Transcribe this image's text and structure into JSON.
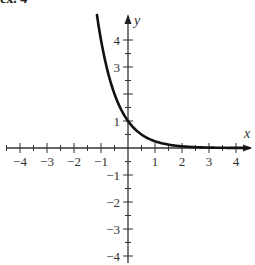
{
  "header": {
    "clipped_text": "ex. 4"
  },
  "chart_data": {
    "type": "line",
    "title": "",
    "xlabel": "x",
    "ylabel": "y",
    "xlim": [
      -4.5,
      4.5
    ],
    "ylim": [
      -4,
      4.9
    ],
    "xticks": [
      -4,
      -3,
      -2,
      -1,
      1,
      2,
      3,
      4
    ],
    "yticks": [
      -4,
      -3,
      -2,
      -1,
      1,
      3,
      4
    ],
    "minor_tick_step": 0.5,
    "grid": false,
    "legend": null,
    "series": [
      {
        "name": "y = (1/4)^x",
        "x": [
          -1.15,
          -1,
          -0.75,
          -0.5,
          -0.25,
          0,
          0.25,
          0.5,
          0.75,
          1,
          1.5,
          2,
          2.5,
          3,
          3.5,
          4,
          4.5
        ],
        "values": [
          4.92,
          4.0,
          2.83,
          2.0,
          1.41,
          1.0,
          0.71,
          0.5,
          0.35,
          0.25,
          0.125,
          0.0625,
          0.031,
          0.016,
          0.008,
          0.004,
          0.002
        ]
      }
    ],
    "annotations": [
      {
        "text": "1",
        "x": 0,
        "y": 1,
        "note": "y-intercept label"
      }
    ]
  }
}
